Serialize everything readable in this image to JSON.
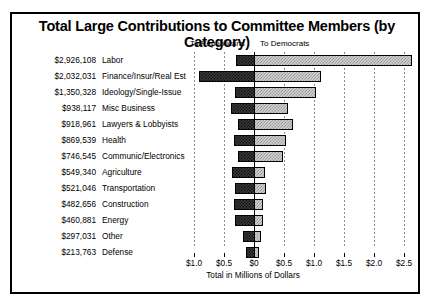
{
  "chart_data": {
    "type": "bar",
    "orientation": "horizontal",
    "style": "diverging-stacked",
    "title": "Total Large Contributions to Committee Members (by Category)",
    "xlabel": "Total in Millions of Dollars",
    "ylabel": "",
    "grid": true,
    "legend_position": "top",
    "legend": [
      {
        "name": "To Republicans",
        "side": "left"
      },
      {
        "name": "To Democrats",
        "side": "right"
      }
    ],
    "xlim": [
      -1.0,
      2.75
    ],
    "xticks": [
      -1.0,
      -0.5,
      0,
      0.5,
      1.0,
      1.5,
      2.0,
      2.5
    ],
    "xticklabels": [
      "$1.0",
      "$0.5",
      "$0",
      "$0.5",
      "$1.0",
      "$1.5",
      "$2.0",
      "$2.5"
    ],
    "categories": [
      "Labor",
      "Finance/Insur/Real Est",
      "Ideology/Single-Issue",
      "Misc Business",
      "Lawyers & Lobbyists",
      "Health",
      "Communic/Electronics",
      "Agriculture",
      "Transportation",
      "Construction",
      "Energy",
      "Other",
      "Defense"
    ],
    "totals_text": [
      "$2,926,108",
      "$2,032,031",
      "$1,350,328",
      "$938,117",
      "$918,961",
      "$869,539",
      "$746,545",
      "$549,340",
      "$521,046",
      "$482,656",
      "$460,881",
      "$297,031",
      "$213,763"
    ],
    "totals": [
      2926108,
      2032031,
      1350328,
      938117,
      918961,
      869539,
      746545,
      549340,
      521046,
      482656,
      460881,
      297031,
      213763
    ],
    "series": [
      {
        "name": "To Republicans",
        "color": "#3a3a3a",
        "values": [
          -0.3,
          -0.92,
          -0.32,
          -0.38,
          -0.27,
          -0.34,
          -0.26,
          -0.37,
          -0.32,
          -0.33,
          -0.31,
          -0.19,
          -0.13
        ]
      },
      {
        "name": "To Democrats",
        "color": "#d2d2d2",
        "values": [
          2.63,
          1.11,
          1.03,
          0.56,
          0.65,
          0.53,
          0.49,
          0.18,
          0.2,
          0.15,
          0.15,
          0.11,
          0.08
        ]
      }
    ]
  },
  "rows": [
    {
      "amount": "$2,926,108",
      "label": "Labor",
      "rep": -0.3,
      "dem": 2.63
    },
    {
      "amount": "$2,032,031",
      "label": "Finance/Insur/Real Est",
      "rep": -0.92,
      "dem": 1.11
    },
    {
      "amount": "$1,350,328",
      "label": "Ideology/Single-Issue",
      "rep": -0.32,
      "dem": 1.03
    },
    {
      "amount": "$938,117",
      "label": "Misc Business",
      "rep": -0.38,
      "dem": 0.56
    },
    {
      "amount": "$918,961",
      "label": "Lawyers & Lobbyists",
      "rep": -0.27,
      "dem": 0.65
    },
    {
      "amount": "$869,539",
      "label": "Health",
      "rep": -0.34,
      "dem": 0.53
    },
    {
      "amount": "$746,545",
      "label": "Communic/Electronics",
      "rep": -0.26,
      "dem": 0.49
    },
    {
      "amount": "$549,340",
      "label": "Agriculture",
      "rep": -0.37,
      "dem": 0.18
    },
    {
      "amount": "$521,046",
      "label": "Transportation",
      "rep": -0.32,
      "dem": 0.2
    },
    {
      "amount": "$482,656",
      "label": "Construction",
      "rep": -0.33,
      "dem": 0.15
    },
    {
      "amount": "$460,881",
      "label": "Energy",
      "rep": -0.31,
      "dem": 0.15
    },
    {
      "amount": "$297,031",
      "label": "Other",
      "rep": -0.19,
      "dem": 0.11
    },
    {
      "amount": "$213,763",
      "label": "Defense",
      "rep": -0.13,
      "dem": 0.08
    }
  ],
  "axis": {
    "ticklabels": [
      "$1.0",
      "$0.5",
      "$0",
      "$0.5",
      "$1.0",
      "$1.5",
      "$2.0",
      "$2.5"
    ],
    "caption": "Total in Millions of Dollars"
  },
  "legend": {
    "republicans": "To Republicans",
    "democrats": "To Democrats"
  },
  "title": "Total Large Contributions to Committee Members (by Category)"
}
